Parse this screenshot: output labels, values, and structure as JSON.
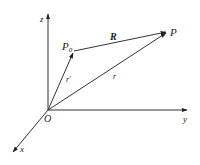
{
  "diagram": {
    "axes": {
      "z": {
        "label": "z"
      },
      "y": {
        "label": "y"
      },
      "x": {
        "label": "x"
      }
    },
    "origin": {
      "label": "O"
    },
    "points": {
      "p0": {
        "label": "P",
        "subscript": "0"
      },
      "p": {
        "label": "P"
      }
    },
    "vectors": {
      "r_prime": {
        "label": "r′",
        "from": "O",
        "to": "P0"
      },
      "r": {
        "label": "r",
        "from": "O",
        "to": "P"
      },
      "R": {
        "label": "R",
        "from": "P0",
        "to": "P"
      }
    },
    "colors": {
      "line": "#333333",
      "background": "#ffffff"
    }
  }
}
